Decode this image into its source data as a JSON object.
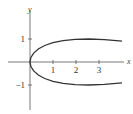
{
  "chart_data": {
    "type": "line",
    "title": "",
    "xlabel": "x",
    "ylabel": "y",
    "x_ticks": [
      "1",
      "2",
      "3"
    ],
    "y_ticks": [
      "1",
      "-1"
    ],
    "xlim": [
      -0.9,
      4.0
    ],
    "ylim": [
      -1.6,
      1.5
    ],
    "grid": false,
    "series": [
      {
        "name": "curve",
        "x": [
          4.0,
          3.24,
          2.56,
          1.96,
          1.44,
          1.0,
          0.64,
          0.36,
          0.16,
          0.04,
          0.0,
          0.04,
          0.16,
          0.36,
          0.64,
          1.0,
          1.44,
          1.96,
          2.56,
          3.24,
          4.0
        ],
        "y": [
          -0.909,
          -0.974,
          -0.9996,
          -0.985,
          -0.932,
          -0.841,
          -0.717,
          -0.565,
          -0.389,
          -0.199,
          0.0,
          0.199,
          0.389,
          0.565,
          0.717,
          0.841,
          0.932,
          0.985,
          0.9996,
          0.974,
          0.909
        ]
      }
    ]
  }
}
